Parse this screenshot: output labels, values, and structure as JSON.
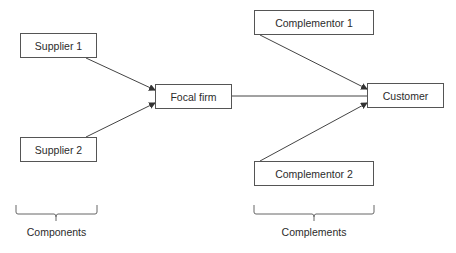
{
  "nodes": {
    "supplier1": {
      "label": "Supplier 1"
    },
    "supplier2": {
      "label": "Supplier 2"
    },
    "focal": {
      "label": "Focal firm"
    },
    "complementor1": {
      "label": "Complementor 1"
    },
    "complementor2": {
      "label": "Complementor 2"
    },
    "customer": {
      "label": "Customer"
    }
  },
  "groups": {
    "components": {
      "label": "Components"
    },
    "complements": {
      "label": "Complements"
    }
  },
  "edges": [
    {
      "from": "Supplier 1",
      "to": "Focal firm"
    },
    {
      "from": "Supplier 2",
      "to": "Focal firm"
    },
    {
      "from": "Focal firm",
      "to": "Customer"
    },
    {
      "from": "Complementor 1",
      "to": "Customer"
    },
    {
      "from": "Complementor 2",
      "to": "Customer"
    }
  ],
  "colors": {
    "line": "#444444",
    "border": "#555555",
    "text": "#2b2b2b"
  }
}
